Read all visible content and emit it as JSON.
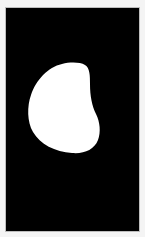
{
  "image": {
    "description": "White kidney/bean-shaped silhouette on a black background with a light border",
    "background_color": "#000000",
    "border_color": "#f4f4f4",
    "shape_color": "#ffffff",
    "shape": "bean-silhouette-icon"
  }
}
